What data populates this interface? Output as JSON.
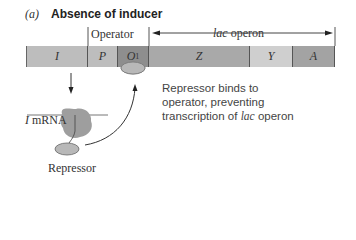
{
  "panel": {
    "label": "(a)",
    "title": "Absence of inducer"
  },
  "labels": {
    "operator": "Operator",
    "lac_operon_italic": "lac",
    "lac_operon_rest": " operon",
    "i_mrna_italic": "I",
    "i_mrna_rest": " mRNA",
    "repressor": "Repressor"
  },
  "segments": [
    {
      "id": "I",
      "label": "I",
      "sub": "",
      "color": "#bdbdbd"
    },
    {
      "id": "P",
      "label": "P",
      "sub": "",
      "color": "#bdbdbd"
    },
    {
      "id": "O1",
      "label": "O",
      "sub": "1",
      "color": "#8e8e8e"
    },
    {
      "id": "Z",
      "label": "Z",
      "sub": "",
      "color": "#a9a9a9"
    },
    {
      "id": "Y",
      "label": "Y",
      "sub": "",
      "color": "#cfcfcf"
    },
    {
      "id": "A",
      "label": "A",
      "sub": "",
      "color": "#a3a3a3"
    }
  ],
  "description": {
    "line1": "Repressor binds to",
    "line2": "operator, preventing",
    "line3_pre": "transcription of ",
    "line3_italic": "lac",
    "line3_post": " operon"
  },
  "colors": {
    "repressor_fill": "#b8b8b8",
    "mrna_blob": "#9e9e9e",
    "line": "#555555"
  }
}
